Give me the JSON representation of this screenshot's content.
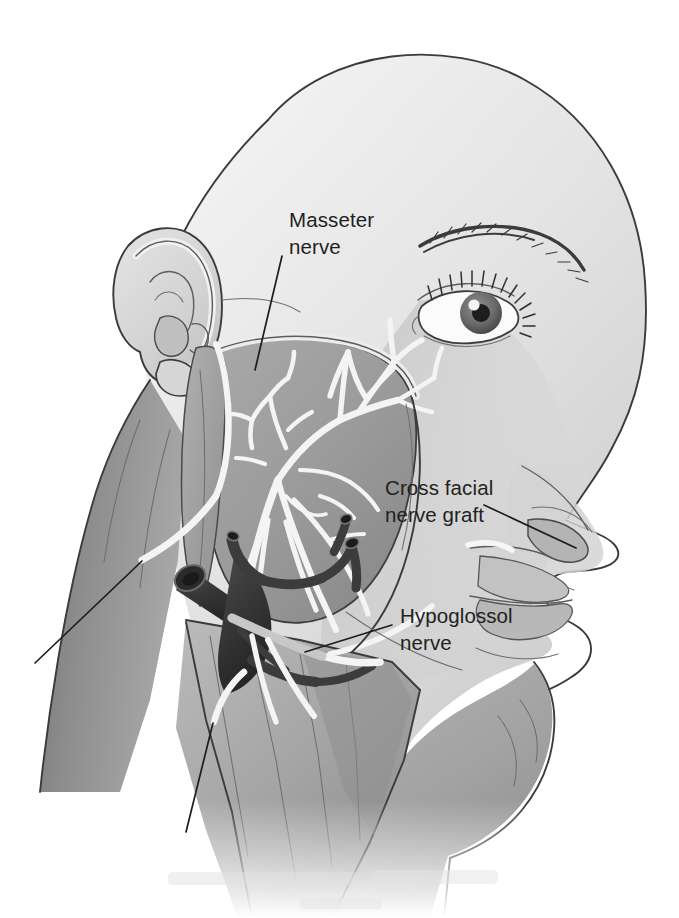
{
  "figure": {
    "view": "right lateral head and neck, surgical dissection",
    "style": "grayscale medical line illustration",
    "background_color": "#ffffff",
    "canvas": {
      "width": 679,
      "height": 918
    }
  },
  "annotations": [
    {
      "id": "masseter-nerve",
      "line1": "Masseter",
      "line2": "nerve",
      "text_x": 289,
      "text_y": 227,
      "leader": "M 282 256 L 255 370",
      "points_to": "nerve to masseter muscle beneath the zygomatic arch"
    },
    {
      "id": "cross-facial-nerve-graft",
      "line1": "Cross facial",
      "line2": "nerve graft",
      "text_x": 385,
      "text_y": 495,
      "leader": "M 484 505 L 576 548",
      "points_to": "sural nerve graft tunneled to the contralateral upper lip"
    },
    {
      "id": "hypoglossol-nerve",
      "line1": "Hypoglossol",
      "line2": "nerve",
      "text_x": 400,
      "text_y": 623,
      "leader": "M 392 625 L 305 652",
      "points_to": "hypoglossal nerve in the submandibular triangle"
    }
  ],
  "unlabeled_leaders": [
    {
      "id": "lower-neck-leader",
      "leader": "M 35 663 L 142 561",
      "points_to": "white nerve stump in the posterior neck"
    },
    {
      "id": "submental-leader",
      "leader": "M 186 832 L 213 723",
      "points_to": "nerve graft end in the anterior neck flap"
    }
  ],
  "structures": [
    {
      "id": "scalp",
      "label": "cranium and scalp",
      "tone": "#ededed"
    },
    {
      "id": "ear",
      "label": "auricle (helix, antihelix, tragus, lobule)",
      "tone": "#dcdcdc"
    },
    {
      "id": "eye",
      "label": "eye with eyelashes and brow",
      "tone": "#f7f7f7"
    },
    {
      "id": "nose",
      "label": "nose and nostril",
      "tone": "#d4d4d4"
    },
    {
      "id": "lips",
      "label": "upper and lower lip",
      "tone": "#c8c8c8"
    },
    {
      "id": "masseter-muscle",
      "label": "masseter muscle bed",
      "tone": "#9d9d9d"
    },
    {
      "id": "facial-nerve-tree",
      "label": "branching facial nerve arborization",
      "tone": "#f4f4f4"
    },
    {
      "id": "vessels",
      "label": "retromandibular and jugular veins, cut ends",
      "tone": "#3c3c3c"
    },
    {
      "id": "neck-flap",
      "label": "reflected cervical skin flap",
      "tone": "#a9a9a9"
    },
    {
      "id": "posterior-neck",
      "label": "posterior neck and trapezius shadow",
      "tone": "#8a8a8a"
    }
  ],
  "ghost_watermark": {
    "present": true,
    "legible": false,
    "note": "faint illegible pale gray text artifact near the bottom margin"
  }
}
